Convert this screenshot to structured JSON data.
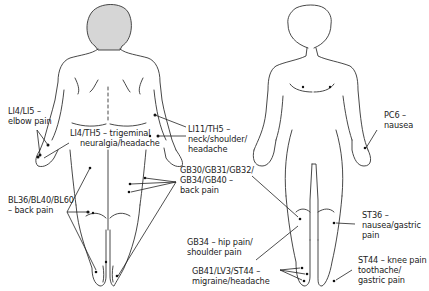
{
  "figure": {
    "views": [
      "posterior",
      "anterior"
    ],
    "colors": {
      "line": "#333333",
      "head_fill": "#d6d6d6",
      "point": "#111111",
      "text": "#222222"
    }
  },
  "labels": {
    "li4_li5": {
      "line1": "LI4/LI5 –",
      "line2": "elbow pain"
    },
    "li4_th5": {
      "line1": "LI4/TH5 – trigeminal",
      "line2": "neuralgia/headache"
    },
    "li11_th5": {
      "line1": "LI11/TH5 –",
      "line2": "neck/shoulder/",
      "line3": "headache"
    },
    "gb_back": {
      "line1": "GB30/GB31/GB32/",
      "line2": "GB34/GB40 –",
      "line3": "back pain"
    },
    "bl_back": {
      "line1": "BL36/BL40/BL60",
      "line2": "– back pain"
    },
    "pc6": {
      "line1": "PC6 –",
      "line2": "nausea"
    },
    "st36": {
      "line1": "ST36 –",
      "line2": "nausea/gastric",
      "line3": "pain"
    },
    "gb34": {
      "line1": "GB34 – hip pain/",
      "line2": "shoulder pain"
    },
    "gb41": {
      "line1": "GB41/LV3/ST44 –",
      "line2": "migraine/headache"
    },
    "st44": {
      "line1": "ST44 – knee pain",
      "line2": "toothache/",
      "line3": "gastric pain"
    }
  }
}
